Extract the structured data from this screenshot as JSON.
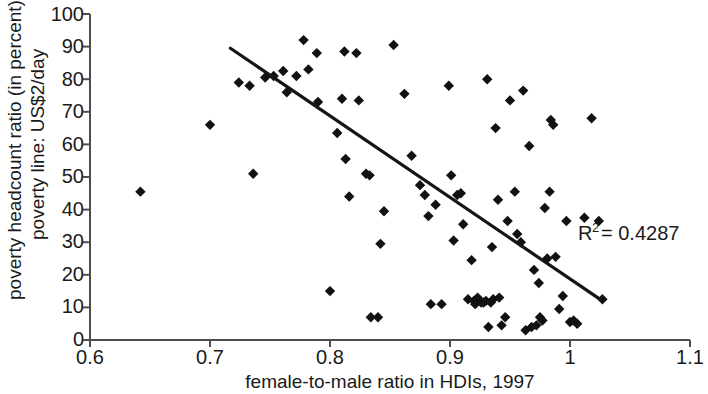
{
  "chart_data": {
    "type": "scatter",
    "title": "",
    "xlabel": "female-to-male ratio in HDIs, 1997",
    "ylabel": "poverty headcount ratio (in percent)\npoverty line: US$2/day",
    "ylabel_line1": "poverty headcount ratio (in percent)",
    "ylabel_line2": "poverty line: US$2/day",
    "xlim": [
      0.6,
      1.1
    ],
    "ylim": [
      0,
      100
    ],
    "xticks": [
      0.6,
      0.7,
      0.8,
      0.9,
      1,
      1.1
    ],
    "xtick_labels": [
      "0.6",
      "0.7",
      "0.8",
      "0.9",
      "1",
      "1.1"
    ],
    "yticks": [
      0,
      10,
      20,
      30,
      40,
      50,
      60,
      70,
      80,
      90,
      100
    ],
    "ytick_labels": [
      "0",
      "10",
      "20",
      "30",
      "40",
      "50",
      "60",
      "70",
      "80",
      "90",
      "100"
    ],
    "grid": false,
    "legend": "none",
    "marker_style": "diamond",
    "marker_color": "#111111",
    "series": [
      {
        "name": "countries",
        "points": [
          [
            0.642,
            45.5
          ],
          [
            0.7,
            66.0
          ],
          [
            0.724,
            79.0
          ],
          [
            0.733,
            78.0
          ],
          [
            0.736,
            51.0
          ],
          [
            0.746,
            80.5
          ],
          [
            0.753,
            81.0
          ],
          [
            0.761,
            82.5
          ],
          [
            0.764,
            76.0
          ],
          [
            0.772,
            81.0
          ],
          [
            0.778,
            92.0
          ],
          [
            0.782,
            83.0
          ],
          [
            0.789,
            88.0
          ],
          [
            0.79,
            73.0
          ],
          [
            0.8,
            15.0
          ],
          [
            0.806,
            63.5
          ],
          [
            0.81,
            74.0
          ],
          [
            0.812,
            88.5
          ],
          [
            0.813,
            55.5
          ],
          [
            0.816,
            44.0
          ],
          [
            0.822,
            88.0
          ],
          [
            0.824,
            73.5
          ],
          [
            0.83,
            51.0
          ],
          [
            0.833,
            50.5
          ],
          [
            0.834,
            7.0
          ],
          [
            0.84,
            7.0
          ],
          [
            0.842,
            29.5
          ],
          [
            0.845,
            39.5
          ],
          [
            0.853,
            90.5
          ],
          [
            0.862,
            75.5
          ],
          [
            0.868,
            56.5
          ],
          [
            0.875,
            47.5
          ],
          [
            0.879,
            44.5
          ],
          [
            0.882,
            38.0
          ],
          [
            0.884,
            11.0
          ],
          [
            0.888,
            41.5
          ],
          [
            0.893,
            11.0
          ],
          [
            0.899,
            78.0
          ],
          [
            0.901,
            50.5
          ],
          [
            0.903,
            30.5
          ],
          [
            0.906,
            44.5
          ],
          [
            0.909,
            45.0
          ],
          [
            0.911,
            35.5
          ],
          [
            0.915,
            12.5
          ],
          [
            0.918,
            24.5
          ],
          [
            0.92,
            12.0
          ],
          [
            0.921,
            11.0
          ],
          [
            0.923,
            13.0
          ],
          [
            0.926,
            11.5
          ],
          [
            0.928,
            11.5
          ],
          [
            0.93,
            12.0
          ],
          [
            0.931,
            80.0
          ],
          [
            0.932,
            4.0
          ],
          [
            0.934,
            11.5
          ],
          [
            0.935,
            28.5
          ],
          [
            0.936,
            12.5
          ],
          [
            0.938,
            65.0
          ],
          [
            0.94,
            43.0
          ],
          [
            0.941,
            13.0
          ],
          [
            0.943,
            4.5
          ],
          [
            0.946,
            7.0
          ],
          [
            0.948,
            36.5
          ],
          [
            0.95,
            73.5
          ],
          [
            0.954,
            45.5
          ],
          [
            0.956,
            32.5
          ],
          [
            0.959,
            30.0
          ],
          [
            0.961,
            76.5
          ],
          [
            0.963,
            3.0
          ],
          [
            0.966,
            59.5
          ],
          [
            0.968,
            4.0
          ],
          [
            0.97,
            21.5
          ],
          [
            0.972,
            4.5
          ],
          [
            0.974,
            17.5
          ],
          [
            0.975,
            7.0
          ],
          [
            0.977,
            6.0
          ],
          [
            0.979,
            40.5
          ],
          [
            0.981,
            25.0
          ],
          [
            0.983,
            45.5
          ],
          [
            0.984,
            67.5
          ],
          [
            0.986,
            66.0
          ],
          [
            0.988,
            25.5
          ],
          [
            0.991,
            9.5
          ],
          [
            0.994,
            13.5
          ],
          [
            0.997,
            36.5
          ],
          [
            1.0,
            5.5
          ],
          [
            1.003,
            6.0
          ],
          [
            1.006,
            5.0
          ],
          [
            1.012,
            37.5
          ],
          [
            1.018,
            68.0
          ],
          [
            1.024,
            36.5
          ],
          [
            1.027,
            12.5
          ]
        ]
      }
    ],
    "trendline": {
      "x_start": 0.717,
      "y_start": 89.5,
      "x_end": 1.027,
      "y_end": 12.0,
      "color": "#151515"
    },
    "annotations": [
      {
        "name": "r-squared",
        "text_prefix": "R",
        "text_superscript": "2",
        "text_suffix": " = 0.4287",
        "full_text": "R2 = 0.4287",
        "x": 1.022,
        "y": 23.5
      }
    ]
  }
}
